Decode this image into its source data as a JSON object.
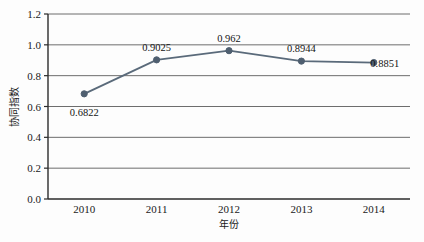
{
  "chart_data": {
    "type": "line",
    "title": "",
    "xlabel": "年份",
    "ylabel": "协同指数",
    "categories": [
      "2010",
      "2011",
      "2012",
      "2013",
      "2014"
    ],
    "values": [
      0.6822,
      0.9025,
      0.962,
      0.8944,
      0.8851
    ],
    "point_labels": [
      "0.6822",
      "0.9025",
      "0.962",
      "0.8944",
      "0.8851"
    ],
    "series": [
      {
        "name": "协同指数",
        "values": [
          0.6822,
          0.9025,
          0.962,
          0.8944,
          0.8851
        ]
      }
    ],
    "ylim": [
      0.0,
      1.2
    ],
    "ytick_values": [
      0.0,
      0.2,
      0.4,
      0.6,
      0.8,
      1.0,
      1.2
    ],
    "ytick_labels": [
      "0.0",
      "0.2",
      "0.4",
      "0.6",
      "0.8",
      "1.0",
      "1.2"
    ],
    "xtick_labels": [
      "2010",
      "2011",
      "2012",
      "2013",
      "2014"
    ],
    "grid": true,
    "grid_axis": "y",
    "legend": false,
    "legend_position": "none",
    "colors": {
      "line": "#5a6a7a",
      "marker": "#4f5f70",
      "grid": "#6d6d6d",
      "axis": "#2b2b2b",
      "text": "#1a1a1a",
      "background": "#fdfdfd"
    },
    "marker_style": "circle",
    "line_width": 1.8
  }
}
